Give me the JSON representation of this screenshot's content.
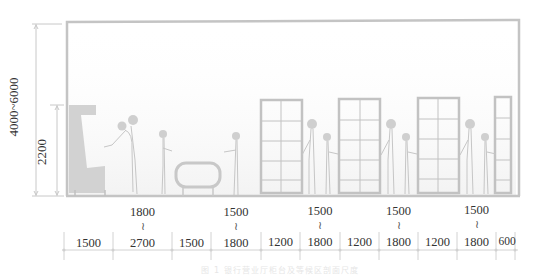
{
  "diagram": {
    "type": "interior section elevation",
    "vertical_dimensions": {
      "room_height": "4000~6000",
      "partition_height": "2200"
    },
    "horizontal_dimensions": [
      {
        "id": "d1",
        "top": "",
        "bottom": "1500"
      },
      {
        "id": "d2",
        "top": "1800",
        "tilde": "≀",
        "bottom": "2700"
      },
      {
        "id": "d3",
        "top": "",
        "bottom": "1500"
      },
      {
        "id": "d4",
        "top": "1500",
        "tilde": "≀",
        "bottom": "1800"
      },
      {
        "id": "d5",
        "top": "",
        "bottom": "1200"
      },
      {
        "id": "d6",
        "top": "1500",
        "tilde": "≀",
        "bottom": "1800"
      },
      {
        "id": "d7",
        "top": "",
        "bottom": "1200"
      },
      {
        "id": "d8",
        "top": "1500",
        "tilde": "≀",
        "bottom": "1800"
      },
      {
        "id": "d9",
        "top": "",
        "bottom": "1200"
      },
      {
        "id": "d10",
        "top": "1500",
        "tilde": "≀",
        "bottom": "1800"
      },
      {
        "id": "d11",
        "top": "",
        "bottom": "600"
      }
    ],
    "elements": [
      "counter",
      "staff-figure",
      "customer-figure",
      "waiting-bench",
      "customer-figure",
      "window-partition",
      "adult-figure",
      "child-figure",
      "window-partition",
      "adult-figure",
      "child-figure",
      "window-partition",
      "adult-figure",
      "child-figure",
      "window-partition"
    ],
    "colors": {
      "line": "#bdbdbd",
      "fill": "#d0d0d0",
      "text": "#333333",
      "figure": "#c8c8c8"
    }
  },
  "caption": "图 1 银行营业厅柜台及等候区剖面尺度"
}
